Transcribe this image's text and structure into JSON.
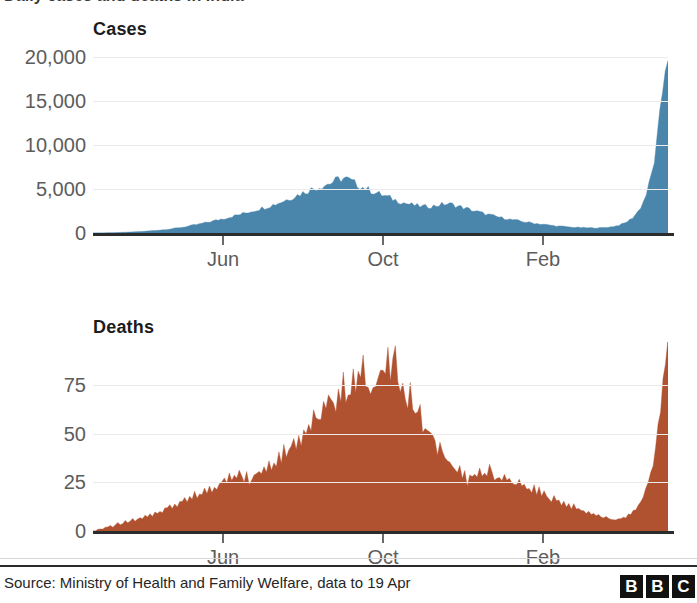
{
  "headline": {
    "text": "Daily cases and deaths in India"
  },
  "footer": {
    "source": "Source: Ministry of Health and Family Welfare, data to 19 Apr",
    "logo_letters": [
      "B",
      "B",
      "C"
    ]
  },
  "colors": {
    "cases_fill": "#4a86ab",
    "deaths_fill": "#b0512f",
    "axis": "#2c2c2c",
    "grid": "#eceaea",
    "tick_text": "#5c5c5c"
  },
  "chart_data": [
    {
      "type": "area",
      "title": "Cases",
      "xlabel": "",
      "ylabel": "",
      "ylim": [
        0,
        21500
      ],
      "yticks": [
        0,
        5000,
        10000,
        15000,
        20000
      ],
      "ytick_labels": [
        "0",
        "5,000",
        "10,000",
        "15,000",
        "20,000"
      ],
      "grid": true,
      "legend": "none",
      "xticks": [
        222,
        382,
        542
      ],
      "xtick_labels": [
        "Jun",
        "Oct",
        "Feb"
      ],
      "x_domain_note": "Daily series spanning roughly Mar 2020 to 19 Apr 2021",
      "values": [
        0,
        2,
        5,
        8,
        12,
        18,
        25,
        32,
        40,
        52,
        62,
        75,
        88,
        100,
        115,
        130,
        145,
        160,
        175,
        195,
        215,
        240,
        265,
        290,
        320,
        350,
        380,
        415,
        450,
        490,
        530,
        575,
        620,
        670,
        720,
        775,
        830,
        890,
        950,
        1015,
        1080,
        1150,
        1220,
        1290,
        1360,
        1430,
        1500,
        1575,
        1650,
        1720,
        1800,
        1880,
        1960,
        2040,
        2120,
        2200,
        2290,
        2380,
        2470,
        2560,
        2650,
        2740,
        2830,
        2920,
        3010,
        3100,
        3200,
        3310,
        3420,
        3540,
        3660,
        3790,
        3920,
        4050,
        4180,
        4310,
        4440,
        4570,
        4700,
        4830,
        4950,
        5060,
        5160,
        5260,
        5360,
        5460,
        5560,
        5680,
        5810,
        5950,
        6080,
        6180,
        6230,
        6150,
        6000,
        5830,
        5660,
        5500,
        5350,
        5200,
        5060,
        4930,
        4800,
        4680,
        4560,
        4440,
        4320,
        4200,
        4090,
        3980,
        3870,
        3760,
        3650,
        3550,
        3450,
        3360,
        3280,
        3210,
        3150,
        3100,
        3060,
        3030,
        3010,
        3010,
        3030,
        3070,
        3130,
        3200,
        3260,
        3300,
        3310,
        3280,
        3220,
        3140,
        3050,
        2960,
        2870,
        2780,
        2690,
        2600,
        2510,
        2420,
        2330,
        2250,
        2170,
        2090,
        2010,
        1940,
        1870,
        1800,
        1730,
        1670,
        1610,
        1550,
        1490,
        1440,
        1390,
        1340,
        1290,
        1240,
        1190,
        1150,
        1110,
        1070,
        1030,
        990,
        950,
        910,
        875,
        840,
        810,
        780,
        750,
        725,
        700,
        680,
        660,
        640,
        625,
        610,
        600,
        590,
        585,
        580,
        580,
        585,
        595,
        610,
        630,
        660,
        700,
        750,
        810,
        890,
        990,
        1120,
        1290,
        1500,
        1760,
        2080,
        2480,
        2980,
        3600,
        4400,
        5400,
        6700,
        8300,
        10400,
        13000,
        16200,
        19200,
        20600
      ],
      "peak_first_wave": 6230,
      "peak_second_wave": 20600
    },
    {
      "type": "area",
      "title": "Deaths",
      "xlabel": "",
      "ylabel": "",
      "ylim": [
        0,
        97
      ],
      "yticks": [
        0,
        25,
        50,
        75
      ],
      "ytick_labels": [
        "0",
        "25",
        "50",
        "75"
      ],
      "grid": true,
      "legend": "none",
      "xticks": [
        222,
        382,
        542
      ],
      "xtick_labels": [
        "Jun",
        "Oct",
        "Feb"
      ],
      "x_domain_note": "Daily series spanning roughly Mar 2020 to 19 Apr 2021",
      "values": [
        0,
        0,
        1,
        1,
        1,
        2,
        2,
        3,
        2,
        3,
        4,
        3,
        4,
        5,
        4,
        5,
        6,
        5,
        6,
        7,
        6,
        8,
        7,
        9,
        8,
        10,
        9,
        11,
        10,
        12,
        11,
        13,
        12,
        14,
        13,
        15,
        14,
        16,
        15,
        17,
        16,
        19,
        17,
        20,
        18,
        21,
        20,
        23,
        21,
        24,
        22,
        26,
        24,
        27,
        25,
        28,
        26,
        30,
        28,
        33,
        30,
        27,
        29,
        26,
        28,
        31,
        29,
        32,
        30,
        34,
        31,
        36,
        33,
        38,
        35,
        40,
        37,
        43,
        40,
        45,
        42,
        48,
        45,
        51,
        47,
        53,
        50,
        56,
        52,
        58,
        55,
        61,
        57,
        64,
        60,
        67,
        63,
        70,
        66,
        73,
        69,
        76,
        71,
        74,
        70,
        78,
        73,
        81,
        76,
        84,
        78,
        72,
        76,
        80,
        74,
        79,
        83,
        77,
        82,
        87,
        80,
        85,
        88,
        82,
        78,
        73,
        70,
        66,
        71,
        65,
        61,
        58,
        62,
        55,
        52,
        49,
        54,
        47,
        44,
        41,
        46,
        39,
        36,
        34,
        38,
        32,
        30,
        28,
        33,
        27,
        29,
        25,
        31,
        27,
        29,
        26,
        30,
        28,
        31,
        29,
        32,
        30,
        28,
        27,
        29,
        26,
        28,
        25,
        27,
        24,
        26,
        23,
        25,
        22,
        24,
        21,
        23,
        20,
        22,
        19,
        21,
        18,
        20,
        17,
        18,
        16,
        17,
        15,
        16,
        14,
        15,
        13,
        14,
        12,
        13,
        11,
        12,
        10,
        11,
        9,
        10,
        9,
        9,
        8,
        8,
        7,
        7,
        7,
        6,
        6,
        6,
        6,
        6,
        6,
        7,
        7,
        8,
        9,
        10,
        11,
        13,
        15,
        18,
        21,
        25,
        30,
        36,
        43,
        52,
        62,
        74,
        85,
        95
      ],
      "peak_first_wave": 88,
      "peak_second_wave": 95
    }
  ]
}
